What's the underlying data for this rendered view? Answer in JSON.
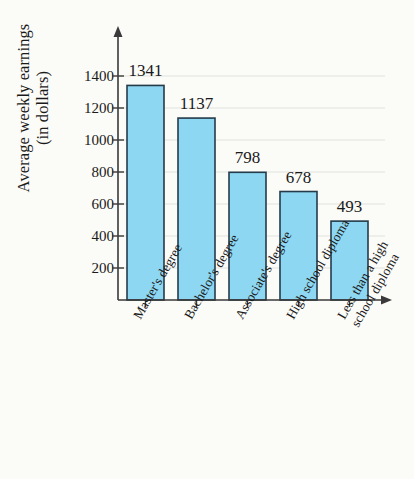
{
  "chart_data": {
    "type": "bar",
    "title": "",
    "subtitle": "",
    "xlabel": "",
    "ylabel": "Average weekly earnings (in dollars)",
    "ylabel_lines": [
      "Average weekly earnings",
      "(in dollars)"
    ],
    "categories": [
      "Master's degree",
      "Bachelor's degree",
      "Associate's degree",
      "High school diploma",
      "Less than a high school diploma"
    ],
    "category_lines": [
      [
        "Master's degree"
      ],
      [
        "Bachelor's degree"
      ],
      [
        "Associate's degree"
      ],
      [
        "High school diploma"
      ],
      [
        "Less than a high",
        "school diploma"
      ]
    ],
    "values": [
      1341,
      1137,
      798,
      678,
      493
    ],
    "value_labels": [
      "1341",
      "1137",
      "798",
      "678",
      "493"
    ],
    "ylim": [
      0,
      1500
    ],
    "yticks": [
      200,
      400,
      600,
      800,
      1000,
      1200,
      1400
    ],
    "ytick_labels": [
      "200",
      "400",
      "600",
      "800",
      "1000",
      "1200",
      "1400"
    ],
    "grid": true,
    "grid_orientation": "horizontal",
    "legend": null,
    "bar_color": "#8ed7f2",
    "bar_border_color": "#243b4a",
    "axis_color": "#3a3a3a",
    "grid_color": "#bdbdbd",
    "background_color": "#fbfbf8",
    "text_color": "#1a1a1a"
  }
}
